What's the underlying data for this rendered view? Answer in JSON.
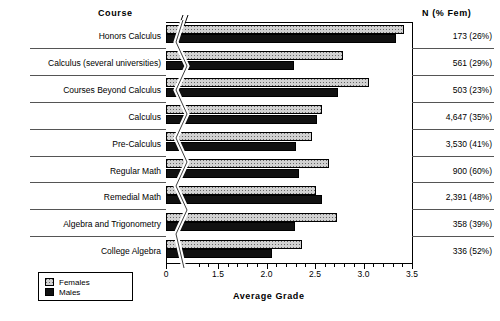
{
  "headers": {
    "course": "Course",
    "n_percent_female": "N (% Fem)",
    "xaxis_title": "Average Grade"
  },
  "legend": {
    "females_label": "Females",
    "males_label": "Males",
    "females_color": "#d2d2d2",
    "males_color": "#111111"
  },
  "axis": {
    "tick_labels": [
      "0",
      "1.5",
      "2.0",
      "2.5",
      "3.0",
      "3.5"
    ],
    "has_break": true,
    "min": 0,
    "max": 3.5
  },
  "chart_data": {
    "type": "bar",
    "title": "",
    "xlabel": "Average Grade",
    "ylabel": "Course",
    "xlim": [
      0,
      3.5
    ],
    "orientation": "horizontal",
    "grid": false,
    "legend_position": "bottom-left",
    "axis_break": "between 0 and 1.3",
    "categories": [
      "Honors Calculus",
      "Calculus (several universities)",
      "Courses Beyond Calculus",
      "Calculus",
      "Pre-Calculus",
      "Regular Math",
      "Remedial Math",
      "Algebra and Trigonometry",
      "College Algebra"
    ],
    "series": [
      {
        "name": "Females",
        "values": [
          3.42,
          2.79,
          3.06,
          2.57,
          2.47,
          2.64,
          2.51,
          2.73,
          2.37
        ]
      },
      {
        "name": "Males",
        "values": [
          3.34,
          2.28,
          2.74,
          2.52,
          2.3,
          2.34,
          2.57,
          2.29,
          2.06
        ]
      }
    ],
    "annotations": {
      "n_label": "N (% Fem)",
      "n_values": [
        "173 (26%)",
        "561 (29%)",
        "503 (23%)",
        "4,647 (35%)",
        "3,530 (41%)",
        "900 (60%)",
        "2,391 (48%)",
        "358 (39%)",
        "336 (52%)"
      ]
    }
  },
  "rows": [
    {
      "category": "Honors Calculus",
      "female": 3.42,
      "male": 3.34,
      "n": "173 (26%)"
    },
    {
      "category": "Calculus (several universities)",
      "female": 2.79,
      "male": 2.28,
      "n": "561 (29%)"
    },
    {
      "category": "Courses Beyond Calculus",
      "female": 3.06,
      "male": 2.74,
      "n": "503 (23%)"
    },
    {
      "category": "Calculus",
      "female": 2.57,
      "male": 2.52,
      "n": "4,647 (35%)"
    },
    {
      "category": "Pre-Calculus",
      "female": 2.47,
      "male": 2.3,
      "n": "3,530 (41%)"
    },
    {
      "category": "Regular Math",
      "female": 2.64,
      "male": 2.34,
      "n": "900 (60%)"
    },
    {
      "category": "Remedial Math",
      "female": 2.51,
      "male": 2.57,
      "n": "2,391 (48%)"
    },
    {
      "category": "Algebra and Trigonometry",
      "female": 2.73,
      "male": 2.29,
      "n": "358 (39%)"
    },
    {
      "category": "College Algebra",
      "female": 2.37,
      "male": 2.06,
      "n": "336 (52%)"
    }
  ]
}
